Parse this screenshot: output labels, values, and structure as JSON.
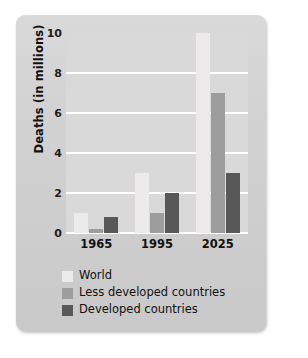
{
  "chart_data": {
    "type": "bar",
    "title": "",
    "subtitle": "",
    "xlabel": "",
    "ylabel": "Deaths (in millions)",
    "categories": [
      "1965",
      "1995",
      "2025"
    ],
    "ylim": [
      0,
      10
    ],
    "yticks": [
      0,
      2,
      4,
      6,
      8,
      10
    ],
    "ytick_labels": [
      "0",
      "2",
      "4",
      "6",
      "8",
      "10"
    ],
    "grid": true,
    "grid_axis": "y",
    "legend_position": "below-plot-left",
    "series": [
      {
        "name": "World",
        "color": "#eceaea",
        "values": [
          1.0,
          3.0,
          10.0
        ]
      },
      {
        "name": "Less developed countries",
        "color": "#9d9d9d",
        "values": [
          0.2,
          1.0,
          7.0
        ]
      },
      {
        "name": "Developed countries",
        "color": "#585858",
        "values": [
          0.8,
          2.0,
          3.0
        ]
      }
    ]
  },
  "colors": {
    "card_background": "#cfcfcf",
    "plot_background": "#d9d9d9",
    "gridline": "#ffffff",
    "text": "#111111",
    "page_background": "#ffffff"
  },
  "legend": {
    "items": [
      {
        "label": "World",
        "color": "#eceaea"
      },
      {
        "label": "Less developed countries",
        "color": "#9d9d9d"
      },
      {
        "label": "Developed countries",
        "color": "#585858"
      }
    ]
  }
}
